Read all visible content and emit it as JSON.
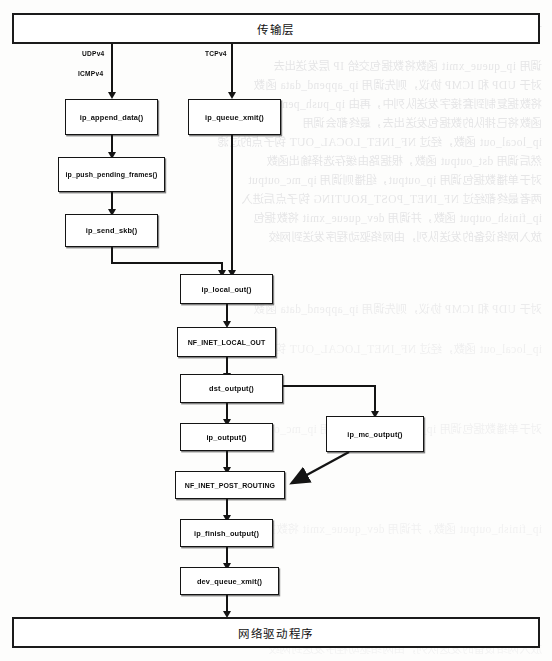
{
  "diagram": {
    "top_band": {
      "label": "传输层"
    },
    "bottom_band": {
      "label": "网络驱动程序"
    },
    "edge_labels": [
      {
        "id": "udpv4",
        "text": "UDPv4"
      },
      {
        "id": "icmpv4",
        "text": "ICMPv4"
      },
      {
        "id": "tcpv4",
        "text": "TCPv4"
      }
    ],
    "nodes": [
      {
        "id": "ip_append_data",
        "label": "ip_append_data()"
      },
      {
        "id": "ip_queue_xmit",
        "label": "ip_queue_xmit()"
      },
      {
        "id": "ip_push_pending",
        "label": "ip_push_pending_frames()"
      },
      {
        "id": "ip_send_skb",
        "label": "ip_send_skb()"
      },
      {
        "id": "ip_local_out",
        "label": "ip_local_out()"
      },
      {
        "id": "nf_inet_local_out",
        "label": "NF_INET_LOCAL_OUT"
      },
      {
        "id": "dst_output",
        "label": "dst_output()"
      },
      {
        "id": "ip_output",
        "label": "ip_output()"
      },
      {
        "id": "ip_mc_output",
        "label": "ip_mc_output()"
      },
      {
        "id": "nf_inet_post_routing",
        "label": "NF_INET_POST_ROUTING"
      },
      {
        "id": "ip_finish_output",
        "label": "ip_finish_output()"
      },
      {
        "id": "dev_queue_xmit",
        "label": "dev_queue_xmit()"
      }
    ],
    "colors": {
      "ink": "#141414",
      "page": "#fdfdfc",
      "box_fill": "#ffffff",
      "ghost_ink": "#6b6b78"
    },
    "ghost_text": [
      "一个套接字缓冲区发送到下层协议模块进行处理",
      "调用 ip_queue_xmit 函数将数据包交给 IP 层发送出去",
      "对于 UDP 和 ICMP 协议，则先调用 ip_append_data 函数",
      "将数据复制到套接字发送队列中，再由 ip_push_pending_frames",
      "函数将已排队的数据包发送出去，最终都会调用",
      "ip_local_out 函数，经过 NF_INET_LOCAL_OUT 钩子点的过滤",
      "然后调用 dst_output 函数，根据路由缓存选择输出函数",
      "对于单播数据包调用 ip_output，组播则调用 ip_mc_output",
      "两者最终都经过 NF_INET_POST_ROUTING 钩子点后进入",
      "ip_finish_output 函数，并调用 dev_queue_xmit 将数据包",
      "放入网络设备的发送队列，由网络驱动程序发送到网绞"
    ]
  }
}
